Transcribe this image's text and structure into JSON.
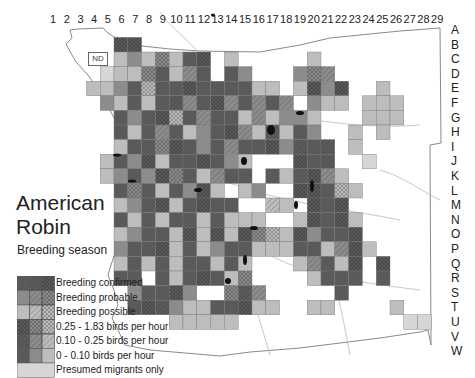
{
  "title_line1": "American",
  "title_line2": "Robin",
  "subtitle": "Breeding season",
  "nd_label": "ND",
  "column_labels": [
    "1",
    "2",
    "3",
    "4",
    "5",
    "6",
    "7",
    "8",
    "9",
    "10",
    "11",
    "12",
    "13",
    "14",
    "15",
    "16",
    "17",
    "18",
    "19",
    "20",
    "21",
    "22",
    "23",
    "24",
    "25",
    "26",
    "27",
    "28",
    "29"
  ],
  "row_labels": [
    "A",
    "B",
    "C",
    "D",
    "E",
    "F",
    "G",
    "H",
    "I",
    "J",
    "K",
    "L",
    "M",
    "N",
    "O",
    "P",
    "Q",
    "R",
    "S",
    "T",
    "U",
    "V",
    "W"
  ],
  "legend": [
    {
      "label": "Breeding confirmed"
    },
    {
      "label": "Breeding probable"
    },
    {
      "label": "Breeding possible"
    },
    {
      "label": "0.25 - 1.83 birds per hour"
    },
    {
      "label": "0.10 - 0.25 birds per hour"
    },
    {
      "label": "0 - 0.10 birds per hour"
    },
    {
      "label": "Presumed migrants only"
    }
  ],
  "colors": {
    "confirmed": "#5a5a5a",
    "probable": "#8c8c8c",
    "possible": "#bdbdbd",
    "migrant": "#d6d6d6",
    "road": "#b4b4b4",
    "border": "#7a7a7a",
    "water": "#111111"
  },
  "grid_cells": [
    "B6:1x",
    "B7:1x",
    "C6:3",
    "C7:2",
    "C8:3",
    "C9:2c",
    "C10:3",
    "C11:1",
    "C12:1x",
    "C13:0",
    "C14:3",
    "C15:0",
    "C20:3",
    "D5:4",
    "D6:3",
    "D7:3",
    "D8:2c",
    "D9:1",
    "D10:3",
    "D11:2h",
    "D12:1",
    "D13:0",
    "D14:1",
    "D15:2",
    "D19:2",
    "D20:2c",
    "D21:2h",
    "E4:3",
    "E5:3",
    "E6:2",
    "E7:1",
    "E8:3c",
    "E9:1",
    "E10:1",
    "E11:1x",
    "E12:1",
    "E13:1",
    "E14:1",
    "E15:1",
    "E16:3",
    "E17:3",
    "E19:3",
    "E20:1x",
    "E21:2",
    "E22:1x",
    "E25:3",
    "F5:2",
    "F6:3",
    "F7:1",
    "F8:3",
    "F9:1",
    "F10:1h",
    "F11:2h",
    "F12:1",
    "F13:1x",
    "F14:2h",
    "F15:1",
    "F16:2h",
    "F17:1",
    "F18:2h",
    "F20:2",
    "F21:3",
    "F22:3",
    "F24:3",
    "F25:3",
    "F26:3",
    "G6:1",
    "G7:2",
    "G8:1",
    "G9:1x",
    "G10:3c",
    "G11:1",
    "G12:2h",
    "G13:1",
    "G14:1",
    "G15:3",
    "G16:2h",
    "G17:3",
    "G18:2",
    "G19:2",
    "G20:3",
    "G24:3",
    "G25:3",
    "G26:3",
    "H6:1",
    "H7:3",
    "H8:1",
    "H9:2h",
    "H10:1",
    "H11:3",
    "H12:2",
    "H13:1",
    "H14:1x",
    "H15:2h",
    "H16:3",
    "H17:1",
    "H18:3",
    "H19:1",
    "H20:2",
    "H23:3",
    "H25:3",
    "I6:3",
    "I7:1",
    "I8:1",
    "I9:2c",
    "I10:1x",
    "I11:1",
    "I12:2",
    "I13:1",
    "I14:2h",
    "I15:1",
    "I16:1",
    "I17:1x",
    "I18:2",
    "I19:1h",
    "I20:1",
    "I21:1h",
    "I23:3",
    "J5:3",
    "J6:1",
    "J7:2",
    "J8:1x",
    "J9:3",
    "J10:1",
    "J11:1",
    "J12:1x",
    "J13:1",
    "J14:2",
    "J15:3",
    "J19:1x",
    "J20:1",
    "J21:1h",
    "J24:4",
    "K5:3",
    "K6:2",
    "K7:1",
    "K8:2",
    "K9:1x",
    "K10:2c",
    "K11:1",
    "K12:3",
    "K13:2h",
    "K14:1",
    "K15:1",
    "K17:1",
    "K18:3",
    "K19:1",
    "K20:1x",
    "K21:2h",
    "K22:3",
    "L6:1",
    "L7:2c",
    "L8:1",
    "L9:3",
    "L10:1",
    "L11:2",
    "L12:1x",
    "L13:3",
    "L15:3",
    "L16:2",
    "L19:1x",
    "L20:1x",
    "L21:1",
    "L22:3c",
    "L23:3",
    "M6:3",
    "M7:2",
    "M8:1",
    "M9:1x",
    "M10:3",
    "M11:1",
    "M12:1x",
    "M13:1",
    "M14:1",
    "M17:3h",
    "M18:3",
    "M20:1x",
    "M21:1",
    "M22:1x",
    "N6:1",
    "N7:3",
    "N8:1",
    "N9:3",
    "N10:1",
    "N11:1",
    "N12:3",
    "N13:1",
    "N14:3",
    "N15:3",
    "N16:3",
    "N19:3",
    "N20:1x",
    "N21:1",
    "N22:1x",
    "N23:3",
    "O6:3",
    "O7:2",
    "O8:1",
    "O9:1",
    "O10:3",
    "O11:1x",
    "O12:3",
    "O13:1x",
    "O14:3",
    "O15:1x",
    "O16:2c",
    "O17:3c",
    "O18:3",
    "O19:1x",
    "O20:2",
    "O21:1",
    "O22:1",
    "O23:1x",
    "P6:2",
    "P7:1",
    "P8:1",
    "P9:1x",
    "P10:3",
    "P11:1",
    "P12:3",
    "P13:2",
    "P14:1",
    "P15:1",
    "P16:3",
    "P17:3",
    "P18:3",
    "P19:1",
    "P20:1",
    "P21:3",
    "P22:2h",
    "P23:1x",
    "P24:3",
    "Q6:3",
    "Q7:1",
    "Q8:3",
    "Q9:1",
    "Q10:3",
    "Q11:1",
    "Q12:1",
    "Q13:3",
    "Q14:1",
    "Q15:3",
    "Q19:3",
    "Q20:2h",
    "Q21:1",
    "Q22:3",
    "Q23:1x",
    "Q25:1x",
    "R6:1",
    "R7:1",
    "R9:1",
    "R10:3",
    "R11:1",
    "R12:1x",
    "R13:1",
    "R14:3",
    "R15:2c",
    "R20:3",
    "R21:1",
    "R22:1",
    "R23:1",
    "R25:1",
    "S7:2",
    "S8:1",
    "S9:1",
    "S10:1x",
    "S11:2",
    "S14:2c",
    "S15:1h",
    "S16:2h",
    "S22:1",
    "T7:1",
    "T8:1x",
    "T9:1h",
    "T10:2",
    "T11:3",
    "T12:3",
    "T13:1",
    "T14:1",
    "T15:1x",
    "T16:3",
    "T17:3",
    "T20:3",
    "T21:3",
    "T26:3",
    "U10:3",
    "U11:3",
    "U12:3",
    "U13:3",
    "U14:3",
    "U27:4",
    "U28:4"
  ]
}
